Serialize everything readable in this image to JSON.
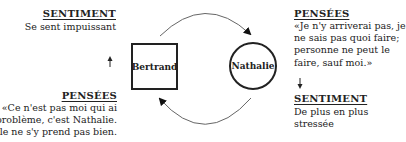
{
  "top_clipped_text": "…",
  "nodes": {
    "bertrand": {
      "label": "Bertrand",
      "shape": "square"
    },
    "nathalie": {
      "label": "Nathalie",
      "shape": "circle"
    }
  },
  "left": {
    "sentiment": {
      "heading": "SENTIMENT",
      "lines": [
        "Se sent impuissant"
      ]
    },
    "pensees": {
      "heading": "PENSÉES",
      "lines": [
        "«Ce n'est pas moi qui ai",
        "le problème, c'est Nathalie.",
        "Elle ne s'y prend pas bien."
      ]
    }
  },
  "right": {
    "pensees": {
      "heading": "PENSÉES",
      "lines": [
        "«Je n'y arriverai pas, je",
        "ne sais pas quoi faire;",
        "personne ne peut le",
        "faire, sauf moi.»"
      ]
    },
    "sentiment": {
      "heading": "SENTIMENT",
      "lines": [
        "De plus en plus",
        "stressée"
      ]
    }
  },
  "colors": {
    "ink": "#222222",
    "arc": "#666666",
    "background": "#ffffff"
  }
}
